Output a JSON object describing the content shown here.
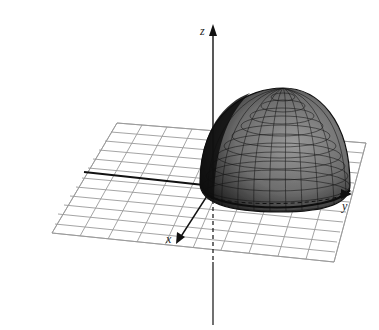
{
  "figure": {
    "axes": {
      "z_label": "z",
      "y_label": "y",
      "x_label": "x"
    },
    "colors": {
      "grid": "#9a9a9a",
      "axis": "#111111",
      "surface_dark": "#1e1e1e",
      "surface_light": "#8a8a8a",
      "mesh": "#111111"
    }
  }
}
